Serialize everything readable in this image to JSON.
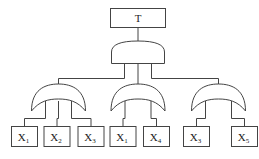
{
  "diagram": {
    "type": "fault-tree",
    "top_event": {
      "label": "T",
      "gate": "AND"
    },
    "subgates": [
      {
        "gate": "OR",
        "inputs": [
          {
            "base": "X",
            "sub": "1"
          },
          {
            "base": "X",
            "sub": "2"
          },
          {
            "base": "X",
            "sub": "3"
          }
        ]
      },
      {
        "gate": "OR",
        "inputs": [
          {
            "base": "X",
            "sub": "1"
          },
          {
            "base": "X",
            "sub": "4"
          }
        ]
      },
      {
        "gate": "OR",
        "inputs": [
          {
            "base": "X",
            "sub": "3"
          },
          {
            "base": "X",
            "sub": "5"
          }
        ]
      }
    ]
  }
}
